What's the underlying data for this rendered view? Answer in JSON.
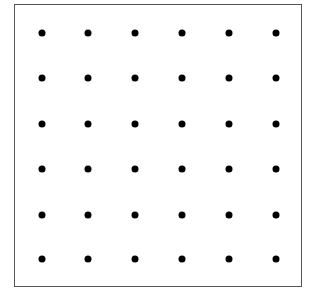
{
  "diagram": {
    "type": "dot-grid",
    "rows": 6,
    "columns": 6,
    "dot_color": "#000000",
    "border_color": "#555555",
    "dot_x": [
      42,
      88,
      135,
      182,
      229,
      276
    ],
    "dot_y": [
      33,
      78,
      124,
      169,
      215,
      259
    ]
  }
}
